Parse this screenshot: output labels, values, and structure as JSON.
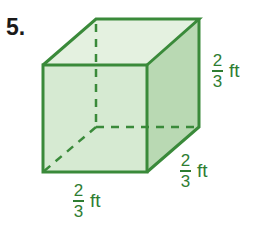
{
  "problem": {
    "number": "5."
  },
  "figure": {
    "shape": "cube",
    "colors": {
      "edge": "#3a8a3a",
      "front_face": "#d6ead2",
      "top_face": "#e4f1e0",
      "side_face": "#b9d9b3",
      "label": "#2e7d32"
    }
  },
  "labels": {
    "height": {
      "numerator": "2",
      "denominator": "3",
      "unit": "ft"
    },
    "depth": {
      "numerator": "2",
      "denominator": "3",
      "unit": "ft"
    },
    "width": {
      "numerator": "2",
      "denominator": "3",
      "unit": "ft"
    }
  }
}
